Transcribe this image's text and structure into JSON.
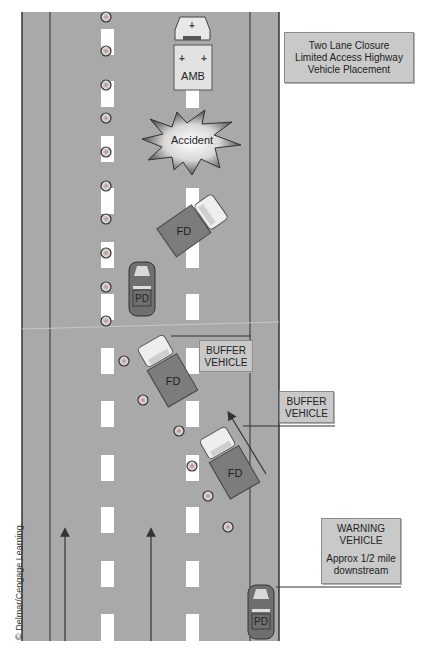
{
  "title_box": {
    "lines": [
      "Two Lane Closure",
      "Limited Access Highway",
      "Vehicle Placement"
    ]
  },
  "vehicles": {
    "ambulance": {
      "label": "AMB"
    },
    "accident": {
      "label": "Accident"
    },
    "fd_top": {
      "label": "FD"
    },
    "pd_middle": {
      "label": "PD"
    },
    "fd_buffer_1": {
      "label": "FD"
    },
    "fd_buffer_2": {
      "label": "FD"
    },
    "pd_warning": {
      "label": "PD"
    }
  },
  "callouts": {
    "buffer_vehicle_1": {
      "lines": [
        "BUFFER",
        "VEHICLE"
      ]
    },
    "buffer_vehicle_2": {
      "lines": [
        "BUFFER",
        "VEHICLE"
      ]
    },
    "warning_vehicle": {
      "lines": [
        "WARNING",
        "VEHICLE",
        "",
        "Approx 1/2 mile",
        "downstream"
      ]
    }
  },
  "credit": "© Delmar/Cengage Learning.",
  "colors": {
    "road": "#a9a9a9",
    "lane_dash": "#ffffff",
    "edge_line": "#444444",
    "fd_truck": "#7c7c7c",
    "pd_car": "#6f6f6f",
    "label_bg": "#c9c9c9"
  }
}
